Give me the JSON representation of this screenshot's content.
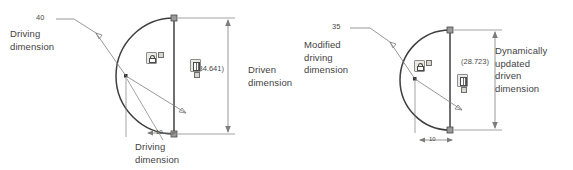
{
  "diagram": {
    "stroke_color": "#3f3f3f",
    "thin_stroke_color": "#7d7d7d"
  },
  "figures": [
    {
      "id": "before",
      "callouts": {
        "left": "Driving\ndimension",
        "left_line1": "Driving",
        "left_line2": "dimension",
        "right_line1": "Driven",
        "right_line2": "dimension",
        "bottom_line1": "Driving",
        "bottom_line2": "dimension"
      },
      "dimensions": {
        "radius": "40",
        "driven_vertical": "(34.641)",
        "horizontal": "10"
      },
      "icons": {
        "lock": "lock-badge-icon",
        "dimension": "dimension-badge-icon"
      }
    },
    {
      "id": "after",
      "callouts": {
        "left_line1": "Modified",
        "left_line2": "driving",
        "left_line3": "dimension",
        "right_line1": "Dynamically",
        "right_line2": "updated",
        "right_line3": "driven",
        "right_line4": "dimension"
      },
      "dimensions": {
        "radius": "35",
        "driven_vertical": "(28.723)",
        "horizontal": "10"
      },
      "icons": {
        "lock": "lock-badge-icon",
        "dimension": "dimension-badge-icon"
      }
    }
  ]
}
